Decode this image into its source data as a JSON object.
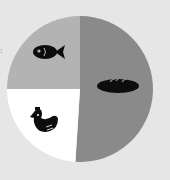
{
  "chart_data": {
    "type": "pie",
    "title": "",
    "slices": [
      {
        "label": "bread",
        "icon": "bread-icon",
        "value": 51,
        "color": "#8a8a8a"
      },
      {
        "label": "chicken",
        "icon": "chicken-icon",
        "value": 24,
        "color": "#ffffff"
      },
      {
        "label": "fish",
        "icon": "fish-icon",
        "value": 25,
        "color": "#b3b3b3"
      }
    ],
    "legend": false
  },
  "colors": {
    "background": "#e6e6e6",
    "icon": "#0d0d0d"
  },
  "margin_mark": ":"
}
